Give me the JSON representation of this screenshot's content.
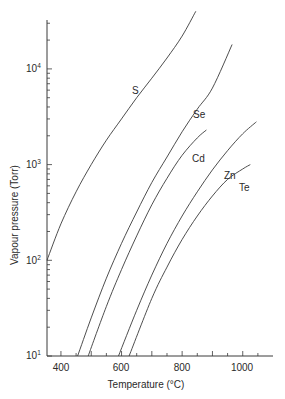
{
  "chart_data": {
    "type": "line",
    "title": "",
    "xlabel": "Temperature (°C)",
    "ylabel": "Vapour pressure (Torr)",
    "xscale": "linear",
    "yscale": "log",
    "xlim": [
      354,
      1060
    ],
    "ylim": [
      10,
      50000
    ],
    "xticks_major": [
      400,
      600,
      800,
      1000
    ],
    "xtick_labels": [
      "400",
      "600",
      "800",
      "1000"
    ],
    "xticks_minor_step": 50,
    "yticks_major": [
      10,
      100,
      1000,
      10000
    ],
    "ytick_labels": [
      "10^1",
      "10^2",
      "10^3",
      "10^4"
    ],
    "grid": false,
    "legend": "inline labels on curves",
    "series": [
      {
        "name": "S",
        "x": [
          354,
          400,
          450,
          500,
          550,
          600,
          650,
          700,
          750,
          800,
          845
        ],
        "y": [
          100,
          240,
          520,
          1000,
          1800,
          3000,
          5000,
          8000,
          13000,
          22000,
          40000
        ]
      },
      {
        "name": "Se",
        "x": [
          455,
          500,
          550,
          600,
          650,
          700,
          750,
          800,
          850,
          900,
          965
        ],
        "y": [
          10,
          25,
          65,
          150,
          320,
          650,
          1200,
          2200,
          3800,
          6300,
          18000
        ]
      },
      {
        "name": "Cd",
        "x": [
          490,
          550,
          600,
          650,
          700,
          750,
          800,
          850,
          880
        ],
        "y": [
          10,
          33,
          80,
          180,
          380,
          720,
          1250,
          1900,
          2300
        ]
      },
      {
        "name": "Zn",
        "x": [
          590,
          650,
          700,
          750,
          800,
          850,
          900,
          950,
          1000,
          1045
        ],
        "y": [
          10,
          30,
          70,
          150,
          290,
          520,
          880,
          1400,
          2100,
          2800
        ]
      },
      {
        "name": "Te",
        "x": [
          625,
          700,
          750,
          800,
          850,
          900,
          950,
          1000,
          1025
        ],
        "y": [
          10,
          40,
          85,
          165,
          290,
          470,
          700,
          900,
          1000
        ]
      }
    ]
  },
  "labels": {
    "xlabel": "Temperature (°C)",
    "ylabel": "Vapour pressure (Torr)",
    "xticks": [
      "400",
      "600",
      "800",
      "1000"
    ],
    "ytick_base": "10",
    "ytick_exps": [
      "4",
      "3",
      "2",
      "1"
    ],
    "curves": {
      "S": "S",
      "Se": "Se",
      "Cd": "Cd",
      "Zn": "Zn",
      "Te": "Te"
    }
  }
}
